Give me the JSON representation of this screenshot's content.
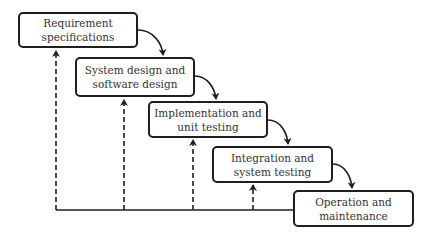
{
  "diagram": {
    "type": "waterfall-model",
    "stages": [
      {
        "label": "Requirement\nspecifications"
      },
      {
        "label": "System design and\nsoftware design"
      },
      {
        "label": "Implementation and\nunit testing"
      },
      {
        "label": "Integration and\nsystem testing"
      },
      {
        "label": "Operation and\nmaintenance"
      }
    ],
    "flow_arrows": [
      {
        "from": 0,
        "to": 1,
        "style": "solid-curved"
      },
      {
        "from": 1,
        "to": 2,
        "style": "solid-curved"
      },
      {
        "from": 2,
        "to": 3,
        "style": "solid-curved"
      },
      {
        "from": 3,
        "to": 4,
        "style": "solid-curved"
      }
    ],
    "feedback_arrows": [
      {
        "from": 4,
        "to": 0,
        "style": "dashed"
      },
      {
        "from": 4,
        "to": 1,
        "style": "dashed"
      },
      {
        "from": 4,
        "to": 2,
        "style": "dashed"
      },
      {
        "from": 4,
        "to": 3,
        "style": "dashed"
      }
    ],
    "colors": {
      "stroke": "#1e1e1e",
      "text": "#333333",
      "background": "#ffffff"
    }
  }
}
